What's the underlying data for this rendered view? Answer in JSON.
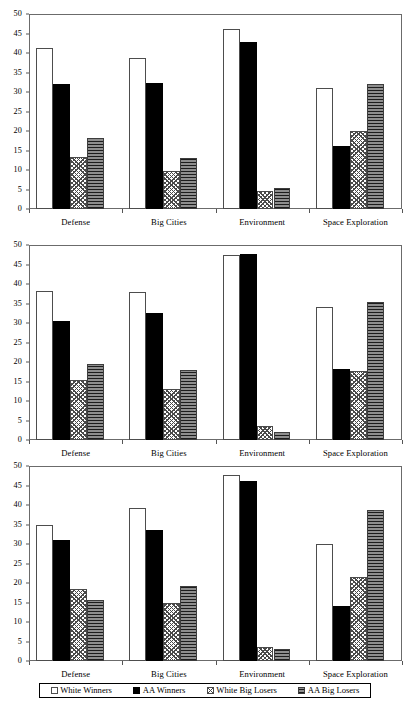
{
  "legend": {
    "items": [
      {
        "label": "White Winners",
        "key": "white_winners",
        "pattern": "open-white",
        "color": "#ffffff"
      },
      {
        "label": "AA Winners",
        "key": "aa_winners",
        "pattern": "solid-black",
        "color": "#000000"
      },
      {
        "label": "White Big Losers",
        "key": "white_big_losers",
        "pattern": "diagonal-crosshatch",
        "color": "#4a4a4a"
      },
      {
        "label": "AA Big Losers",
        "key": "aa_big_losers",
        "pattern": "horizontal-lines",
        "color": "#8e8e8e"
      }
    ]
  },
  "axis": {
    "y_ticks": [
      "0",
      "5",
      "10",
      "15",
      "20",
      "25",
      "30",
      "35",
      "40",
      "45",
      "50"
    ],
    "y_min": 0,
    "y_max": 50,
    "y_step": 5
  },
  "chart_data": [
    {
      "type": "bar",
      "panel": 1,
      "title": "",
      "xlabel": "",
      "ylabel": "",
      "ylim": [
        0,
        50
      ],
      "grid": false,
      "legend_position": "bottom",
      "categories": [
        "Defense",
        "Big Cities",
        "Environment",
        "Space Exploration"
      ],
      "series": [
        {
          "name": "White Winners",
          "values": [
            41.2,
            38.7,
            46.1,
            31.1
          ]
        },
        {
          "name": "AA Winners",
          "values": [
            32.1,
            32.4,
            42.7,
            16.1
          ]
        },
        {
          "name": "White Big Losers",
          "values": [
            13.3,
            9.7,
            4.5,
            20.0
          ]
        },
        {
          "name": "AA Big Losers",
          "values": [
            18.2,
            13.0,
            5.5,
            32.1
          ]
        }
      ]
    },
    {
      "type": "bar",
      "panel": 2,
      "title": "",
      "xlabel": "",
      "ylabel": "",
      "ylim": [
        0,
        50
      ],
      "grid": false,
      "legend_position": "bottom",
      "categories": [
        "Defense",
        "Big Cities",
        "Environment",
        "Space Exploration"
      ],
      "series": [
        {
          "name": "White Winners",
          "values": [
            38.1,
            38.0,
            47.4,
            34.1
          ]
        },
        {
          "name": "AA Winners",
          "values": [
            30.4,
            32.5,
            47.6,
            18.2
          ]
        },
        {
          "name": "White Big Losers",
          "values": [
            15.5,
            13.0,
            3.6,
            17.6
          ]
        },
        {
          "name": "AA Big Losers",
          "values": [
            19.5,
            17.9,
            2.0,
            35.4
          ]
        }
      ]
    },
    {
      "type": "bar",
      "panel": 3,
      "title": "",
      "xlabel": "",
      "ylabel": "",
      "ylim": [
        0,
        50
      ],
      "grid": false,
      "legend_position": "bottom",
      "categories": [
        "Defense",
        "Big Cities",
        "Environment",
        "Space Exploration"
      ],
      "series": [
        {
          "name": "White Winners",
          "values": [
            35.0,
            39.3,
            47.6,
            30.0
          ]
        },
        {
          "name": "AA Winners",
          "values": [
            31.0,
            33.5,
            46.1,
            14.2
          ]
        },
        {
          "name": "White Big Losers",
          "values": [
            18.4,
            14.8,
            3.6,
            21.5
          ]
        },
        {
          "name": "AA Big Losers",
          "values": [
            15.7,
            19.2,
            3.2,
            38.6
          ]
        }
      ]
    }
  ]
}
